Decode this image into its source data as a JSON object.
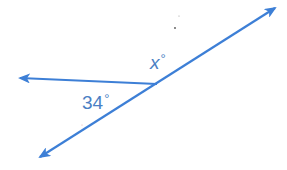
{
  "diagram": {
    "type": "angle-pair",
    "colors": {
      "line": "#3d7fd6",
      "label": "#4a7fc4",
      "background": "#ffffff"
    },
    "vertex": {
      "x": 157,
      "y": 84
    },
    "lines": [
      {
        "name": "transversal-line",
        "from": {
          "x": 40,
          "y": 157
        },
        "to": {
          "x": 275,
          "y": 8
        },
        "arrows": [
          "start",
          "end"
        ]
      },
      {
        "name": "left-ray",
        "from": {
          "x": 157,
          "y": 84
        },
        "to": {
          "x": 20,
          "y": 78
        },
        "arrows": [
          "end"
        ]
      }
    ],
    "labels": {
      "unknown_angle": {
        "variable": "x",
        "degree_symbol": "°"
      },
      "known_angle": {
        "value": "34",
        "degree_symbol": "°"
      }
    }
  }
}
